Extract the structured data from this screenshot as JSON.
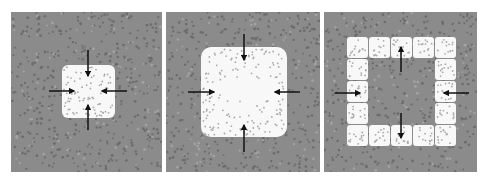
{
  "figure": {
    "colors": {
      "page_background": "#ffffff",
      "field": "#8b8b8b",
      "field_dot": "#6c6c6c",
      "field_speck": "#a4a4a4",
      "region": "#f8f8f8",
      "region_dot": "#a9a9a9",
      "arrow": "#111111"
    },
    "panels": [
      {
        "id": "panel-1",
        "x": 11,
        "y": 12,
        "width": 151,
        "height": 160,
        "shape": "small-square",
        "region": {
          "x": 51,
          "y": 53,
          "width": 53,
          "height": 53,
          "radius": 6
        },
        "arrow_direction": "inward",
        "arrows": [
          {
            "x1": 77,
            "y1": 38,
            "x2": 77,
            "y2": 64
          },
          {
            "x1": 77,
            "y1": 118,
            "x2": 77,
            "y2": 93
          },
          {
            "x1": 38,
            "y1": 79,
            "x2": 63,
            "y2": 79
          },
          {
            "x1": 116,
            "y1": 79,
            "x2": 91,
            "y2": 79
          }
        ]
      },
      {
        "id": "panel-2",
        "x": 166,
        "y": 12,
        "width": 154,
        "height": 160,
        "shape": "large-square-with-clear-center",
        "region": {
          "x": 35,
          "y": 35,
          "width": 86,
          "height": 90,
          "radius": 10
        },
        "arrow_direction": "inward",
        "arrows": [
          {
            "x1": 78,
            "y1": 22,
            "x2": 78,
            "y2": 48
          },
          {
            "x1": 78,
            "y1": 140,
            "x2": 78,
            "y2": 113
          },
          {
            "x1": 22,
            "y1": 80,
            "x2": 48,
            "y2": 80
          },
          {
            "x1": 134,
            "y1": 80,
            "x2": 109,
            "y2": 80
          }
        ]
      },
      {
        "id": "panel-3",
        "x": 324,
        "y": 12,
        "width": 153,
        "height": 160,
        "shape": "ring-of-tiles",
        "ring": {
          "x": 23,
          "y": 25,
          "tile": 21,
          "gap": 1,
          "count": 5,
          "radius": 3
        },
        "arrow_direction": "mixed",
        "arrows": [
          {
            "x1": 77,
            "y1": 60,
            "x2": 77,
            "y2": 35
          },
          {
            "x1": 77,
            "y1": 101,
            "x2": 77,
            "y2": 126
          },
          {
            "x1": 11,
            "y1": 81,
            "x2": 36,
            "y2": 81
          },
          {
            "x1": 145,
            "y1": 81,
            "x2": 120,
            "y2": 81
          }
        ]
      }
    ]
  }
}
